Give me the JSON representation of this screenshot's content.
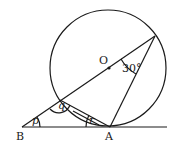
{
  "diagram": {
    "type": "geometry",
    "points": {
      "O": {
        "label": "O",
        "x": 109,
        "y": 68
      },
      "A": {
        "label": "A",
        "x": 110,
        "y": 127
      },
      "B": {
        "label": "B",
        "x": 22,
        "y": 127
      },
      "C": {
        "x": 60,
        "y": 100
      },
      "D": {
        "x": 155,
        "y": 36
      }
    },
    "circle": {
      "cx": 108,
      "cy": 68,
      "r": 58
    },
    "angles": {
      "p": "p",
      "q": "q",
      "r": "r",
      "angle_at_D": "30°"
    },
    "colors": {
      "ink": "#1a1a1a",
      "background": "#ffffff"
    }
  }
}
